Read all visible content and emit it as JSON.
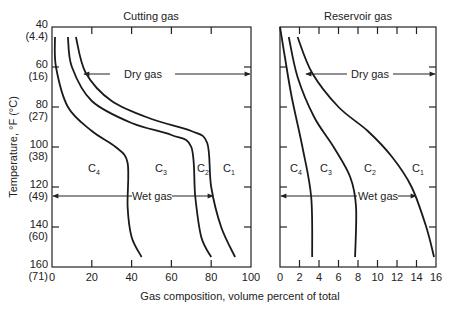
{
  "chart_data": [
    {
      "type": "line",
      "title": "Cutting gas",
      "xlabel": "Gas composition, volume percent of total",
      "ylabel": "Temperature, °F (°C)",
      "xlim": [
        0,
        100
      ],
      "ylim": [
        160,
        40
      ],
      "x_ticks": [
        "0",
        "20",
        "40",
        "60",
        "80",
        "100"
      ],
      "y_ticks": [
        {
          "f": "40",
          "c": "(4.4)"
        },
        {
          "f": "60",
          "c": "(16)"
        },
        {
          "f": "80",
          "c": "(27)"
        },
        {
          "f": "100",
          "c": "(38)"
        },
        {
          "f": "120",
          "c": "(49)"
        },
        {
          "f": "140",
          "c": "(60)"
        },
        {
          "f": "160",
          "c": "(71)"
        }
      ],
      "region_labels": [
        "C4",
        "C3",
        "C2",
        "C1"
      ],
      "annotations": [
        {
          "text": "Dry gas",
          "y_temp_F": 65,
          "x_from": 16,
          "x_to": 100
        },
        {
          "text": "Wet gas",
          "y_temp_F": 124,
          "x_from": 0,
          "x_to": 80
        }
      ],
      "series": [
        {
          "name": "C4 / C3 boundary",
          "points": [
            [
              1.5,
              45
            ],
            [
              2,
              60
            ],
            [
              8,
              80
            ],
            [
              20,
              92
            ],
            [
              32,
              100
            ],
            [
              38,
              108
            ],
            [
              38,
              130
            ],
            [
              40,
              145
            ],
            [
              45,
              155
            ]
          ]
        },
        {
          "name": "C3 / C2 boundary",
          "points": [
            [
              8,
              45
            ],
            [
              10,
              60
            ],
            [
              20,
              77
            ],
            [
              40,
              88
            ],
            [
              60,
              94
            ],
            [
              70,
              100
            ],
            [
              72,
              125
            ],
            [
              75,
              145
            ],
            [
              80,
              155
            ]
          ]
        },
        {
          "name": "C2 / C1 boundary",
          "points": [
            [
              12,
              45
            ],
            [
              17,
              63
            ],
            [
              30,
              77
            ],
            [
              50,
              86
            ],
            [
              70,
              92
            ],
            [
              78,
              98
            ],
            [
              80,
              120
            ],
            [
              85,
              140
            ],
            [
              92,
              155
            ]
          ]
        }
      ]
    },
    {
      "type": "line",
      "title": "Reservoir gas",
      "xlabel": "Gas composition, volume percent of total",
      "ylabel": "Temperature, °F (°C)",
      "xlim": [
        0,
        16
      ],
      "ylim": [
        160,
        40
      ],
      "x_ticks": [
        "0",
        "2",
        "4",
        "6",
        "8",
        "10",
        "12",
        "14",
        "16"
      ],
      "region_labels": [
        "C4",
        "C3",
        "C2",
        "C1"
      ],
      "annotations": [
        {
          "text": "Dry gas",
          "y_temp_F": 65,
          "x_from": 3,
          "x_to": 16
        },
        {
          "text": "Wet gas",
          "y_temp_F": 124,
          "x_from": 0,
          "x_to": 14
        }
      ],
      "series": [
        {
          "name": "C4 / C3 boundary",
          "points": [
            [
              0,
              40
            ],
            [
              0.5,
              55
            ],
            [
              1.2,
              75
            ],
            [
              2.3,
              100
            ],
            [
              3.2,
              125
            ],
            [
              3.3,
              155
            ]
          ]
        },
        {
          "name": "C3 / C2 boundary",
          "points": [
            [
              0.9,
              45
            ],
            [
              1.8,
              65
            ],
            [
              3.5,
              85
            ],
            [
              5.5,
              100
            ],
            [
              7.2,
              115
            ],
            [
              7.8,
              130
            ],
            [
              7.7,
              155
            ]
          ]
        },
        {
          "name": "C2 / C1 boundary",
          "points": [
            [
              1.8,
              45
            ],
            [
              3.3,
              63
            ],
            [
              6,
              80
            ],
            [
              9,
              92
            ],
            [
              11.5,
              105
            ],
            [
              13.5,
              120
            ],
            [
              15,
              140
            ],
            [
              15.8,
              155
            ]
          ]
        }
      ]
    }
  ],
  "labels": {
    "left_title": "Cutting gas",
    "right_title": "Reservoir gas",
    "xlabel": "Gas composition, volume percent of total",
    "ylabel": "Temperature, °F (°C)",
    "dry_gas": "Dry gas",
    "wet_gas": "Wet gas",
    "c": "C",
    "sub1": "1",
    "sub2": "2",
    "sub3": "3",
    "sub4": "4"
  }
}
